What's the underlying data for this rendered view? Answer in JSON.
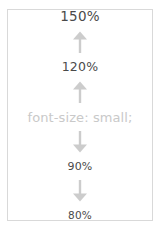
{
  "figure": {
    "border_color": "#d9d9d9",
    "background": "#ffffff",
    "label_color": "#4a4a4a",
    "arrow_color": "#cccccc",
    "caption_color": "#c9c9c9"
  },
  "scale": {
    "steps": [
      {
        "label": "150%",
        "kind": "size-label"
      },
      {
        "icon": "arrow-up-icon"
      },
      {
        "label": "120%",
        "kind": "size-label"
      },
      {
        "icon": "arrow-up-icon"
      },
      {
        "label": "font-size: small;",
        "kind": "caption"
      },
      {
        "icon": "arrow-down-icon"
      },
      {
        "label": "90%",
        "kind": "size-label"
      },
      {
        "icon": "arrow-down-icon"
      },
      {
        "label": "80%",
        "kind": "size-label"
      }
    ],
    "larger_values": [
      "150%",
      "120%"
    ],
    "baseline_declaration": "font-size: small;",
    "smaller_values": [
      "90%",
      "80%"
    ]
  }
}
